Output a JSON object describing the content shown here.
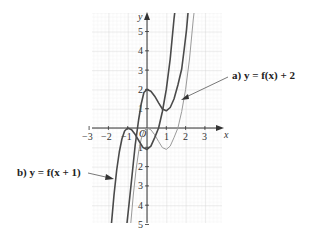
{
  "figure": {
    "x_axis_label": "x",
    "y_axis_label": "y",
    "origin_label": "O",
    "x_ticks": [
      "−3",
      "−2",
      "−1",
      "1",
      "2",
      "3"
    ],
    "y_ticks": [
      "5",
      "4",
      "3",
      "2",
      "1",
      "1",
      "2",
      "3",
      "4",
      "5"
    ],
    "label_a": "a)  y = f(x) + 2",
    "label_b": "b)  y = f(x + 1)",
    "colors": {
      "grid_minor": "#e6e6e6",
      "grid_major": "#cfcfcf",
      "axis": "#333333",
      "original_curve": "#9a9a9a",
      "transformed_curve": "#4a4a4a"
    }
  },
  "curves": [
    {
      "name": "y = f(x)",
      "style": "light",
      "local_max": [
        0,
        0
      ],
      "local_min": [
        1,
        -2
      ]
    },
    {
      "name": "a) y = f(x) + 2",
      "style": "dark",
      "local_max": [
        0,
        2
      ],
      "local_min": [
        1,
        0
      ]
    },
    {
      "name": "b) y = f(x + 1)",
      "style": "dark",
      "local_max": [
        -1,
        0
      ],
      "local_min": [
        0,
        -2
      ]
    }
  ]
}
